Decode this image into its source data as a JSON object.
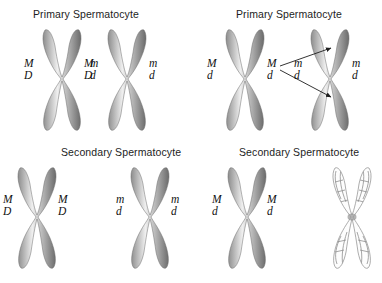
{
  "figure": {
    "background_color": "#ffffff",
    "chromosome_color_dark": "#6f6f6f",
    "chromosome_color_mid": "#9a9a9a",
    "chromosome_color_light": "#e8e8e8",
    "text_color": "#1d1d1d"
  },
  "panels": [
    {
      "id": "top-left",
      "title": "Primary Spermatocyte",
      "chromosomes": [
        {
          "id": "tl-c1",
          "style": "shaded",
          "labels": [
            {
              "side": "left",
              "top": "M",
              "bottom": "D"
            },
            {
              "side": "right",
              "top": "M",
              "bottom": "D"
            }
          ]
        },
        {
          "id": "tl-c2",
          "style": "shaded",
          "labels": [
            {
              "side": "left",
              "top": "m",
              "bottom": "d"
            },
            {
              "side": "right",
              "top": "m",
              "bottom": "d"
            }
          ]
        }
      ]
    },
    {
      "id": "top-right",
      "title": "Primary Spermatocyte",
      "chromosomes": [
        {
          "id": "tr-c1",
          "style": "shaded",
          "labels": [
            {
              "side": "left",
              "top": "M",
              "bottom": "d"
            },
            {
              "side": "right",
              "top": "M",
              "bottom": "d"
            }
          ]
        },
        {
          "id": "tr-c2",
          "style": "shaded",
          "labels": [
            {
              "side": "left",
              "top": "m",
              "bottom": "d"
            },
            {
              "side": "right",
              "top": "m",
              "bottom": "d"
            }
          ]
        }
      ],
      "arrows": [
        {
          "id": "arrow-upper",
          "direction": "up-right"
        },
        {
          "id": "arrow-lower",
          "direction": "down-right"
        }
      ]
    },
    {
      "id": "bottom-left",
      "title": "Secondary Spermatocyte",
      "chromosomes": [
        {
          "id": "bl-c1",
          "style": "shaded",
          "labels": [
            {
              "side": "left",
              "top": "M",
              "bottom": "D"
            },
            {
              "side": "right",
              "top": "M",
              "bottom": "D"
            }
          ]
        },
        {
          "id": "bl-c2",
          "style": "shaded",
          "labels": [
            {
              "side": "left",
              "top": "m",
              "bottom": "d"
            },
            {
              "side": "right",
              "top": "m",
              "bottom": "d"
            }
          ]
        }
      ]
    },
    {
      "id": "bottom-right",
      "title": "Secondary Spermatocyte",
      "chromosomes": [
        {
          "id": "br-c1",
          "style": "shaded",
          "labels": [
            {
              "side": "left",
              "top": "M",
              "bottom": "d"
            },
            {
              "side": "right",
              "top": "M",
              "bottom": "d"
            }
          ]
        },
        {
          "id": "br-c2",
          "style": "outline",
          "labels": []
        }
      ]
    }
  ]
}
